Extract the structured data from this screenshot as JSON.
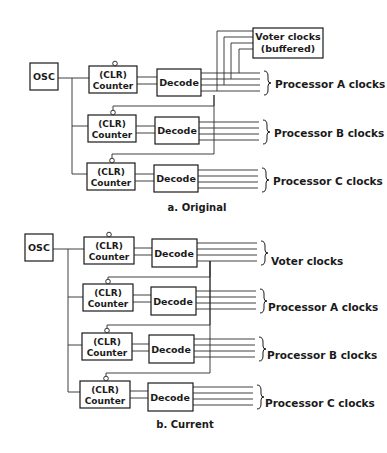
{
  "diagrams": [
    {
      "caption": "a. Original",
      "osc_label": "OSC",
      "counter_label_line1": "(CLR)",
      "counter_label_line2": "Counter",
      "decode_label": "Decode",
      "voter_box_line1": "Voter clocks",
      "voter_box_line2": "(buffered)",
      "outputs": [
        "Processor A clocks",
        "Processor B clocks",
        "Processor C clocks"
      ]
    },
    {
      "caption": "b. Current",
      "osc_label": "OSC",
      "counter_label_line1": "(CLR)",
      "counter_label_line2": "Counter",
      "decode_label": "Decode",
      "outputs": [
        "Voter clocks",
        "Processor A clocks",
        "Processor B clocks",
        "Processor C clocks"
      ]
    }
  ]
}
